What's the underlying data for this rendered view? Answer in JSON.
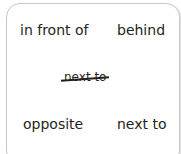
{
  "card": {
    "words": [
      {
        "label": "in front of",
        "position": "top-left"
      },
      {
        "label": "behind",
        "position": "top-right"
      },
      {
        "label": "opposite",
        "position": "bottom-left"
      },
      {
        "label": "next to",
        "position": "bottom-right"
      }
    ],
    "crossed_out": {
      "label": "next to",
      "position": "center",
      "struck": true
    }
  }
}
